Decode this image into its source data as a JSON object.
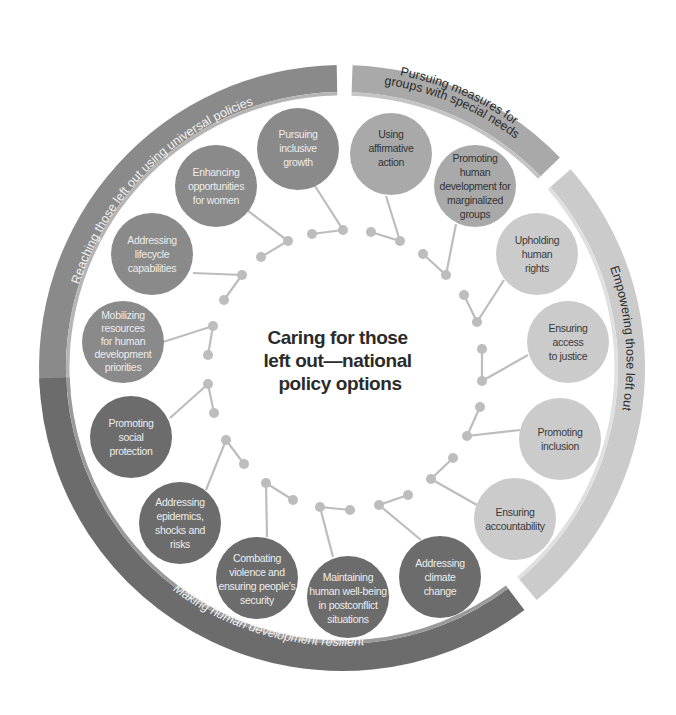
{
  "title": {
    "lines": [
      "Caring for those",
      "left out—national",
      "policy options"
    ]
  },
  "colors": {
    "universal": "#8a8a8a",
    "special_needs": "#a9a9a9",
    "empowering": "#cbcbcb",
    "resilient": "#6c6c6c",
    "connector": "#bdbdbd",
    "dark_text": "#2b2b2b",
    "light_text": "#ececec"
  },
  "ring_segments": [
    {
      "id": "universal",
      "label": "Reaching those left out using universal policies"
    },
    {
      "id": "special_needs",
      "label_line1": "Pursuing measures for",
      "label_line2": "groups with special needs"
    },
    {
      "id": "empowering",
      "label": "Empowering those left out"
    },
    {
      "id": "resilient",
      "label": "Making human development resilient"
    }
  ],
  "nodes": [
    {
      "group": "universal",
      "lines": [
        "Pursuing",
        "inclusive",
        "growth"
      ]
    },
    {
      "group": "universal",
      "lines": [
        "Enhancing",
        "opportunities",
        "for women"
      ]
    },
    {
      "group": "universal",
      "lines": [
        "Addressing",
        "lifecycle",
        "capabilities"
      ]
    },
    {
      "group": "universal",
      "lines": [
        "Mobilizing",
        "resources",
        "for human",
        "development",
        "priorities"
      ]
    },
    {
      "group": "resilient",
      "lines": [
        "Promoting",
        "social",
        "protection"
      ]
    },
    {
      "group": "resilient",
      "lines": [
        "Addressing",
        "epidemics,",
        "shocks and",
        "risks"
      ]
    },
    {
      "group": "resilient",
      "lines": [
        "Combating",
        "violence and",
        "ensuring people’s",
        "security"
      ]
    },
    {
      "group": "resilient",
      "lines": [
        "Maintaining",
        "human well-being",
        "in postconflict",
        "situations"
      ]
    },
    {
      "group": "resilient",
      "lines": [
        "Addressing",
        "climate",
        "change"
      ]
    },
    {
      "group": "empowering",
      "lines": [
        "Ensuring",
        "accountability"
      ]
    },
    {
      "group": "empowering",
      "lines": [
        "Promoting",
        "inclusion"
      ]
    },
    {
      "group": "empowering",
      "lines": [
        "Ensuring",
        "access",
        "to justice"
      ]
    },
    {
      "group": "empowering",
      "lines": [
        "Upholding",
        "human",
        "rights"
      ]
    },
    {
      "group": "special_needs",
      "lines": [
        "Promoting",
        "human",
        "development for",
        "marginalized",
        "groups"
      ]
    },
    {
      "group": "special_needs",
      "lines": [
        "Using",
        "affirmative",
        "action"
      ]
    }
  ]
}
